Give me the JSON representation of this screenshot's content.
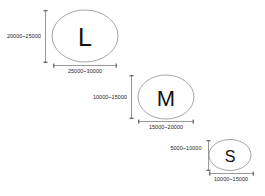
{
  "diagram": {
    "type": "size-classification-ellipses",
    "background_color": "#ffffff",
    "shape_stroke_color": "#9a9a9a",
    "dimension_stroke_color": "#8d8d8d",
    "text_color": "#111111",
    "items": [
      {
        "id": "large",
        "letter": "L",
        "vertical_label": "20000~25000",
        "horizontal_label": "25000~30000"
      },
      {
        "id": "medium",
        "letter": "M",
        "vertical_label": "10000~15000",
        "horizontal_label": "15000~20000"
      },
      {
        "id": "small",
        "letter": "S",
        "vertical_label": "5000~10000",
        "horizontal_label": "10000~15000"
      }
    ]
  }
}
